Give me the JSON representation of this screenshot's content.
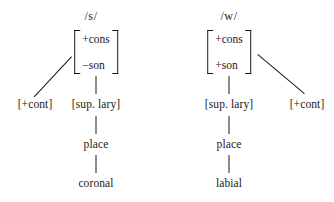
{
  "figure": {
    "type": "feature-geometry-tree-pair",
    "background": "#ffffff",
    "ink": "#1a1a1a"
  },
  "trees": [
    {
      "id": "s",
      "title": "/s/",
      "root_matrix": {
        "features": [
          "+cons",
          "−son"
        ]
      },
      "branches": [
        {
          "label": "[+cont]",
          "direction": "left-diagonal"
        },
        {
          "label": "[sup. lary]",
          "direction": "vertical"
        }
      ],
      "spine": [
        "[sup. lary]",
        "place",
        "coronal"
      ],
      "place_label": "place",
      "terminal_label": "coronal"
    },
    {
      "id": "w",
      "title": "/w/",
      "root_matrix": {
        "features": [
          "+cons",
          "+son"
        ]
      },
      "branches": [
        {
          "label": "[sup. lary]",
          "direction": "vertical"
        },
        {
          "label": "[+cont]",
          "direction": "right-diagonal"
        }
      ],
      "spine": [
        "[sup. lary]",
        "place",
        "labial"
      ],
      "place_label": "place",
      "terminal_label": "labial"
    }
  ]
}
